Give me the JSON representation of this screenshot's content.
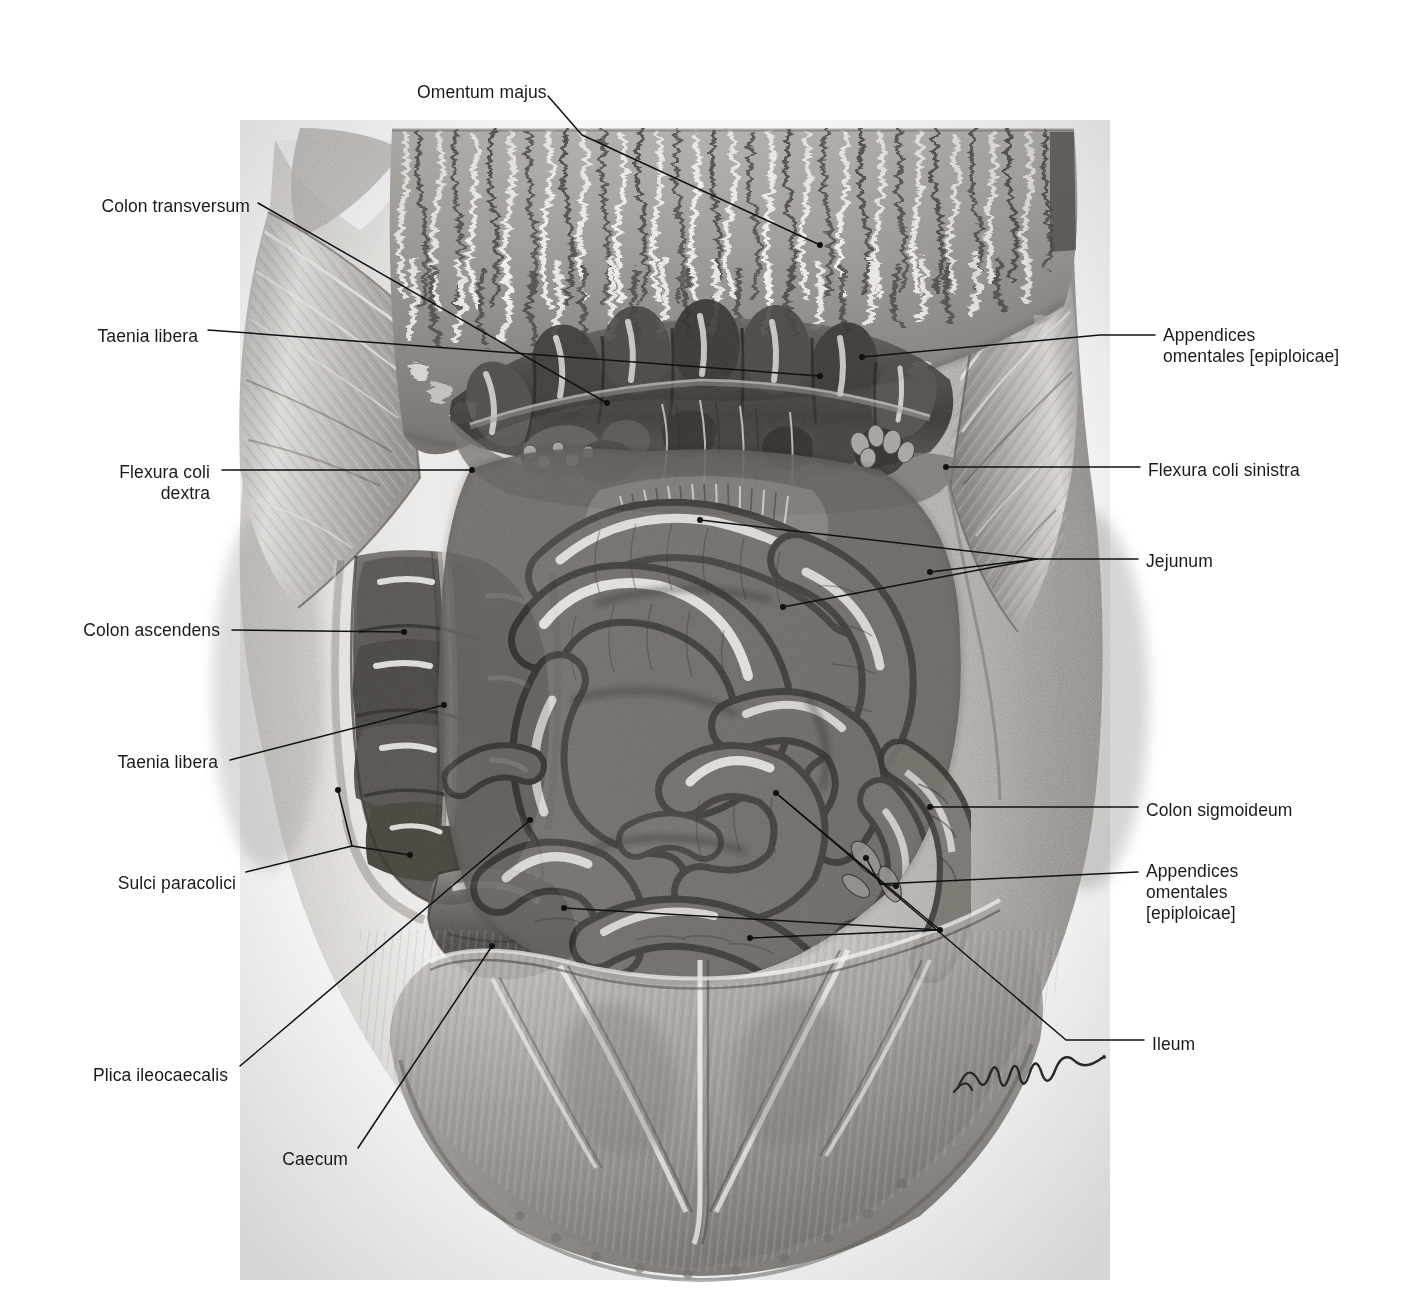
{
  "figure": {
    "kind": "anatomical-illustration",
    "style": "monochrome graphite / halftone engraving",
    "background_color": "#ffffff",
    "ink_color": "#1a1a1a",
    "signature": "Lenier"
  },
  "labels": [
    {
      "id": "omentum-majus",
      "text": "Omentum majus",
      "side": "top",
      "x": 417,
      "y": 82,
      "align": "left"
    },
    {
      "id": "colon-transversum",
      "text": "Colon transversum",
      "side": "left",
      "x": 250,
      "y": 196,
      "align": "right"
    },
    {
      "id": "taenia-libera-upper",
      "text": "Taenia libera",
      "side": "left",
      "x": 198,
      "y": 326,
      "align": "right"
    },
    {
      "id": "flexura-coli-dextra",
      "text": "Flexura coli\ndextra",
      "side": "left",
      "x": 210,
      "y": 462,
      "align": "right"
    },
    {
      "id": "colon-ascendens",
      "text": "Colon ascendens",
      "side": "left",
      "x": 220,
      "y": 620,
      "align": "right"
    },
    {
      "id": "taenia-libera-lower",
      "text": "Taenia libera",
      "side": "left",
      "x": 218,
      "y": 752,
      "align": "right"
    },
    {
      "id": "sulci-paracolici",
      "text": "Sulci paracolici",
      "side": "left",
      "x": 236,
      "y": 873,
      "align": "right"
    },
    {
      "id": "plica-ileocaecalis",
      "text": "Plica ileocaecalis",
      "side": "left",
      "x": 228,
      "y": 1065,
      "align": "right"
    },
    {
      "id": "caecum",
      "text": "Caecum",
      "side": "left",
      "x": 348,
      "y": 1149,
      "align": "right"
    },
    {
      "id": "appendices-omentales-upper",
      "text": "Appendices\nomentales [epiploicae]",
      "side": "right",
      "x": 1163,
      "y": 325,
      "align": "left"
    },
    {
      "id": "flexura-coli-sinistra",
      "text": "Flexura coli sinistra",
      "side": "right",
      "x": 1148,
      "y": 460,
      "align": "left"
    },
    {
      "id": "jejunum",
      "text": "Jejunum",
      "side": "right",
      "x": 1146,
      "y": 551,
      "align": "left"
    },
    {
      "id": "colon-sigmoideum",
      "text": "Colon sigmoideum",
      "side": "right",
      "x": 1146,
      "y": 800,
      "align": "left"
    },
    {
      "id": "appendices-omentales-lower",
      "text": "Appendices\nomentales\n[epiploicae]",
      "side": "right",
      "x": 1146,
      "y": 861,
      "align": "left"
    },
    {
      "id": "ileum",
      "text": "Ileum",
      "side": "right",
      "x": 1152,
      "y": 1034,
      "align": "left"
    }
  ],
  "leaders": [
    {
      "for": "omentum-majus",
      "path": "M 548,96 L 582,135 L 820,245",
      "dots": [
        "820,245"
      ]
    },
    {
      "for": "colon-transversum",
      "path": "M 258,203 L 607,403",
      "dots": [
        "607,403"
      ]
    },
    {
      "for": "taenia-libera-upper",
      "path": "M 208,330 L 820,376",
      "dots": [
        "820,376"
      ]
    },
    {
      "for": "flexura-coli-dextra",
      "path": "M 222,470 L 472,470",
      "dots": [
        "472,470"
      ]
    },
    {
      "for": "colon-ascendens",
      "path": "M 232,630 L 404,632",
      "dots": [
        "404,632"
      ]
    },
    {
      "for": "taenia-libera-lower",
      "path": "M 230,760 L 444,705",
      "dots": [
        "444,705"
      ]
    },
    {
      "for": "sulci-paracolici",
      "path": "M 246,872 L 352,846 L 410,855",
      "dots": [
        "410,855"
      ]
    },
    {
      "for": "sulci-paracolici-b",
      "path": "M 352,846 L 338,790",
      "dots": [
        "338,790"
      ]
    },
    {
      "for": "plica-ileocaecalis",
      "path": "M 240,1066 L 530,820",
      "dots": [
        "530,820"
      ]
    },
    {
      "for": "caecum",
      "path": "M 358,1148 L 492,946",
      "dots": [
        "492,946"
      ]
    },
    {
      "for": "appendices-omentales-upper",
      "path": "M 1155,335 L 1100,335 L 862,357",
      "dots": [
        "862,357"
      ]
    },
    {
      "for": "flexura-coli-sinistra",
      "path": "M 1140,467 L 946,467",
      "dots": [
        "946,467"
      ]
    },
    {
      "for": "jejunum",
      "path": "M 1138,559 L 1037,559 L 783,607",
      "dots": [
        "783,607"
      ]
    },
    {
      "for": "jejunum-b",
      "path": "M 1037,559 L 930,572",
      "dots": [
        "930,572"
      ]
    },
    {
      "for": "jejunum-c",
      "path": "M 1037,559 L 700,520",
      "dots": [
        "700,520"
      ]
    },
    {
      "for": "colon-sigmoideum",
      "path": "M 1138,807 L 930,807",
      "dots": [
        "930,807"
      ]
    },
    {
      "for": "appendices-omentales-lower",
      "path": "M 1138,872 L 880,884 L 866,858",
      "dots": [
        "866,858"
      ]
    },
    {
      "for": "appendices-omentales-lower-b",
      "path": "M 880,884 L 896,886",
      "dots": [
        "896,886"
      ]
    },
    {
      "for": "ileum",
      "path": "M 1144,1040 L 1066,1040 L 776,793",
      "dots": [
        "776,793"
      ]
    },
    {
      "for": "ileum-b",
      "path": "M 940,930 L 776,793",
      "dots": [
        "940,930"
      ]
    },
    {
      "for": "ileum-c",
      "path": "M 940,930 L 564,908",
      "dots": [
        "564,908"
      ]
    },
    {
      "for": "ileum-d",
      "path": "M 940,930 L 750,938",
      "dots": [
        "750,938"
      ]
    }
  ],
  "regions": [
    {
      "id": "torso-skin",
      "name": "Torso and abdominal skin"
    },
    {
      "id": "omentum-majus-sheet",
      "name": "Greater omentum, reflected upward"
    },
    {
      "id": "colon-transversum-body",
      "name": "Transverse colon with haustra"
    },
    {
      "id": "colon-ascendens-body",
      "name": "Ascending colon with haustra and taenia"
    },
    {
      "id": "caecum-body",
      "name": "Caecum"
    },
    {
      "id": "small-intestine",
      "name": "Jejunal and ileal loops"
    },
    {
      "id": "colon-sigmoideum-body",
      "name": "Sigmoid colon"
    },
    {
      "id": "abdominal-wall-flap-left",
      "name": "Reflected left abdominal wall flap"
    },
    {
      "id": "abdominal-wall-flap-right",
      "name": "Reflected right abdominal wall flap"
    },
    {
      "id": "lower-abdominal-wall",
      "name": "Lower abdominal wall with peritoneal folds"
    }
  ]
}
